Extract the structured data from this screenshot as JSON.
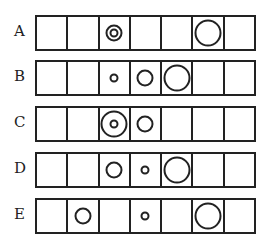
{
  "rows": [
    {
      "label": "A",
      "top": 15,
      "cells": [
        [],
        [],
        [
          "s",
          "m"
        ],
        [],
        [],
        [
          "l"
        ],
        []
      ]
    },
    {
      "label": "B",
      "top": 60,
      "cells": [
        [],
        [],
        [
          "s"
        ],
        [
          "m"
        ],
        [
          "l"
        ],
        [],
        []
      ]
    },
    {
      "label": "C",
      "top": 106,
      "cells": [
        [],
        [],
        [
          "s",
          "l"
        ],
        [
          "m"
        ],
        [],
        [],
        []
      ]
    },
    {
      "label": "D",
      "top": 152,
      "cells": [
        [],
        [],
        [
          "m"
        ],
        [
          "s"
        ],
        [
          "l"
        ],
        [],
        []
      ]
    },
    {
      "label": "E",
      "top": 198,
      "cells": [
        [],
        [
          "m"
        ],
        [],
        [
          "s"
        ],
        [],
        [
          "l"
        ],
        []
      ]
    }
  ]
}
